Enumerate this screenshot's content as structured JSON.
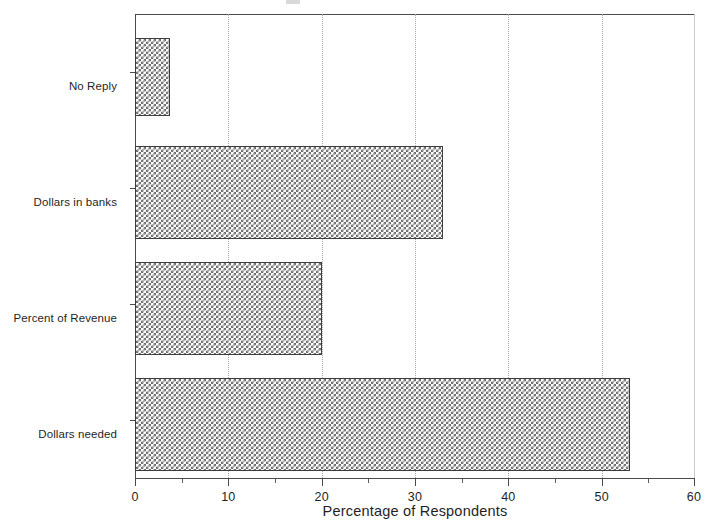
{
  "figure": {
    "background_color": "#ffffff",
    "title_remnant": ""
  },
  "chart_data": {
    "type": "bar",
    "orientation": "horizontal",
    "title": "",
    "xlabel": "Percentage of Respondents",
    "ylabel": "",
    "categories": [
      "No Reply",
      "Dollars in banks",
      "Percent of Revenue",
      "Dollars needed"
    ],
    "values": [
      3.7,
      33,
      20,
      53
    ],
    "xlim": [
      0,
      60
    ],
    "xticks": [
      0,
      10,
      20,
      30,
      40,
      50,
      60
    ],
    "xtick_labels": [
      "0",
      "10",
      "20",
      "30",
      "40",
      "50",
      "60"
    ],
    "minor_xticks": [
      5,
      15,
      25,
      35,
      45,
      55
    ],
    "grid": "vertical-dotted",
    "legend": "none",
    "series": [
      {
        "name": "Percentage of Respondents",
        "values": [
          3.7,
          33,
          20,
          53
        ],
        "fill": "grey-crosshatch",
        "edge_color": "#3d3d3d"
      }
    ]
  },
  "axes": {
    "x_axis_title": "Percentage of Respondents",
    "x_tick_labels": [
      "0",
      "10",
      "20",
      "30",
      "40",
      "50",
      "60"
    ],
    "y_category_labels": [
      "No Reply",
      "Dollars in banks",
      "Percent of Revenue",
      "Dollars needed"
    ]
  },
  "colors": {
    "bar_fill": "#6e6e6e",
    "bar_edge": "#3d3d3d",
    "axis": "#4a4a4a",
    "gridline": "#a8a8a8",
    "text": "#1f1f1f",
    "background": "#ffffff"
  }
}
